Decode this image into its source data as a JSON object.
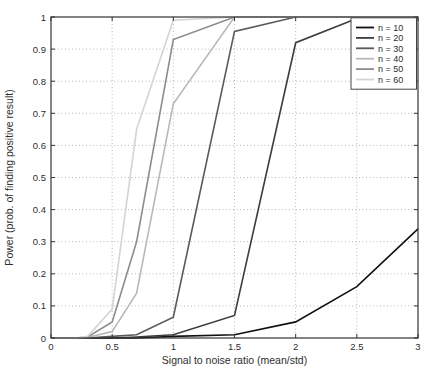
{
  "chart_data": {
    "type": "line",
    "title": "",
    "xlabel": "Signal to noise ratio (mean/std)",
    "ylabel": "Power (prob. of finding positive result)",
    "xlim": [
      0,
      3
    ],
    "ylim": [
      0,
      1
    ],
    "grid": "dotted",
    "legend_position": "top-right-inside",
    "background_color": "#ffffff",
    "grid_color": "#b9b9b9",
    "axis_color": "#333333",
    "xticks": [
      0,
      0.5,
      1,
      1.5,
      2,
      2.5,
      3
    ],
    "xtick_labels": [
      "0",
      "0.5",
      "1",
      "1.5",
      "2",
      "2.5",
      "3"
    ],
    "yticks": [
      0,
      0.1,
      0.2,
      0.3,
      0.4,
      0.5,
      0.6,
      0.7,
      0.8,
      0.9,
      1
    ],
    "ytick_labels": [
      "0",
      "0.1",
      "0.2",
      "0.3",
      "0.4",
      "0.5",
      "0.6",
      "0.7",
      "0.8",
      "0.9",
      "1"
    ],
    "x": [
      0,
      0.1,
      0.2,
      0.3,
      0.5,
      0.7,
      1,
      1.5,
      2,
      2.5,
      3
    ],
    "series": [
      {
        "name": "n = 10",
        "color": "#111111",
        "values": [
          0,
          0,
          0,
          0,
          0,
          0,
          0.005,
          0.01,
          0.05,
          0.16,
          0.34
        ]
      },
      {
        "name": "n = 20",
        "color": "#3d3d3d",
        "values": [
          0,
          0,
          0,
          0,
          0,
          0.003,
          0.01,
          0.07,
          0.92,
          0.995,
          1
        ]
      },
      {
        "name": "n = 30",
        "color": "#5a5a5a",
        "values": [
          0,
          0,
          0,
          0,
          0.005,
          0.01,
          0.065,
          0.955,
          1,
          1,
          1
        ]
      },
      {
        "name": "n = 40",
        "color": "#b8b8b8",
        "values": [
          0,
          0,
          0,
          0.002,
          0.02,
          0.14,
          0.73,
          1,
          1,
          1,
          1
        ]
      },
      {
        "name": "n = 50",
        "color": "#8c8c8c",
        "values": [
          0,
          0,
          0,
          0.003,
          0.05,
          0.3,
          0.93,
          1,
          1,
          1,
          1
        ]
      },
      {
        "name": "n = 60",
        "color": "#d4d4d4",
        "values": [
          0,
          0,
          0,
          0.005,
          0.09,
          0.65,
          0.99,
          1,
          1,
          1,
          1
        ]
      }
    ]
  }
}
